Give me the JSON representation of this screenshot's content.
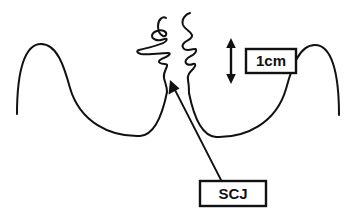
{
  "figure": {
    "kind": "anatomical-line-diagram",
    "background_color": "#ffffff",
    "line_color": "#111111",
    "stroke_width_px": 2
  },
  "labels": {
    "scale": {
      "text": "1cm",
      "box_border_color": "#111111",
      "text_color": "#111111"
    },
    "junction": {
      "text": "SCJ",
      "box_border_color": "#111111",
      "text_color": "#111111"
    }
  },
  "annotations": {
    "scale_arrow": {
      "icon": "double-headed-vertical-arrow",
      "measures": "1cm"
    },
    "leader_line": {
      "icon": "arrow-leader-line",
      "points_from": "SCJ",
      "points_to": "junction-apex"
    }
  },
  "shapes": {
    "left_fold": {
      "name": "left-mucosal-fold-curve",
      "path": "M 17 114 C 17 70, 25 44, 41 44 C 57 44, 64 66, 70 88 C 80 122, 110 137, 140 136 C 155 135, 163 112, 167 92"
    },
    "right_fold": {
      "name": "right-mucosal-fold-curve",
      "path": "M 339 115 C 339 71, 331 45, 315 45 C 299 45, 292 67, 286 89 C 276 123, 246 138, 216 137 C 201 136, 193 113, 189 93"
    },
    "left_squiggle": {
      "name": "left-irregular-mucosa-squiggle",
      "path": "M 166 18 C 163 16, 158 19, 158 26 C 158 32, 161 35, 163 36 C 166 37, 168 33, 164 31 C 159 29, 152 32, 152 36 C 152 39, 157 41, 161 40 C 165 39, 168 37, 166 41 C 163 45, 146 48, 139 50 C 136 51, 137 53, 141 54 C 149 55, 163 53, 168 53 C 171 53, 170 55, 166 57 C 161 59, 157 61, 160 63 C 163 65, 168 63, 167 66 C 166 70, 163 73, 164 78 C 165 83, 167 86, 167 92"
    },
    "right_squiggle": {
      "name": "right-irregular-mucosa-squiggle",
      "path": "M 190 13 C 186 14, 181 19, 183 25 C 185 30, 191 31, 192 35 C 193 39, 187 40, 184 43 C 181 46, 183 50, 188 50 C 193 50, 197 47, 196 51 C 195 56, 188 56, 186 60 C 184 64, 189 66, 193 64 C 196 63, 196 66, 193 69 C 190 72, 187 75, 188 80 C 189 85, 189 89, 189 93"
    }
  }
}
